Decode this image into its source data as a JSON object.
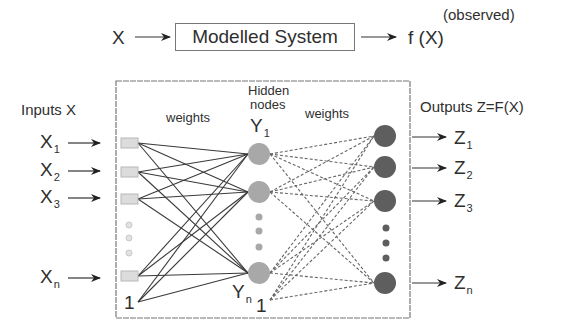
{
  "top_row": {
    "input_label": "X",
    "system_label": "Modelled System",
    "output_label": "f (X)",
    "observed_label": "(observed)"
  },
  "left": {
    "title": "Inputs X",
    "inputs": [
      {
        "base": "X",
        "sub": "1"
      },
      {
        "base": "X",
        "sub": "2"
      },
      {
        "base": "X",
        "sub": "3"
      },
      {
        "base": "X",
        "sub": "n"
      }
    ],
    "bias": "1"
  },
  "middle": {
    "weights_left": "weights",
    "hidden_title_line1": "Hidden",
    "hidden_title_line2": "nodes",
    "hidden_first": {
      "base": "Y",
      "sub": "1"
    },
    "hidden_last": {
      "base": "Y",
      "sub": "n"
    },
    "hidden_bias": "1",
    "weights_right": "weights"
  },
  "right": {
    "title": "Outputs Z=F(X)",
    "outputs": [
      {
        "base": "Z",
        "sub": "1"
      },
      {
        "base": "Z",
        "sub": "2"
      },
      {
        "base": "Z",
        "sub": "3"
      },
      {
        "base": "Z",
        "sub": "n"
      }
    ]
  },
  "colors": {
    "input_square": "#dcdcdc",
    "hidden_node": "#a8a8a8",
    "output_node": "#5e5e5e",
    "solid_edge": "#3a3a3a",
    "dashed_edge": "#666666",
    "frame": "#777777"
  }
}
